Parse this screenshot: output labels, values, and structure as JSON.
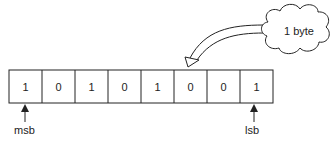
{
  "diagram": {
    "bits": [
      "1",
      "0",
      "1",
      "0",
      "1",
      "0",
      "0",
      "1"
    ],
    "cloud_label": "1 byte",
    "msb_label": "msb",
    "lsb_label": "lsb"
  }
}
